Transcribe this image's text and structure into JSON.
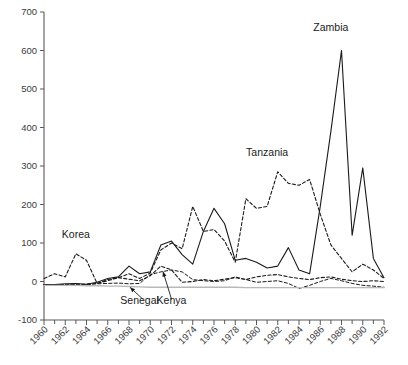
{
  "chart_data": {
    "type": "line",
    "title": "",
    "subtitle": "",
    "xlabel": "",
    "ylabel": "",
    "xlim": [
      1960,
      1992
    ],
    "ylim": [
      -100,
      700
    ],
    "grid": false,
    "legend_position": "inline-annotations",
    "y_ticks": [
      -100,
      0,
      100,
      200,
      300,
      400,
      500,
      600,
      700
    ],
    "y_tick_labels": [
      "-100",
      "0",
      "100",
      "200",
      "300",
      "400",
      "500",
      "600",
      "700"
    ],
    "x_ticks": [
      1960,
      1962,
      1964,
      1966,
      1968,
      1970,
      1972,
      1974,
      1976,
      1978,
      1980,
      1982,
      1984,
      1986,
      1988,
      1990,
      1992
    ],
    "x_tick_labels": [
      "1960",
      "1962",
      "1964",
      "1966",
      "1968",
      "1970",
      "1972",
      "1974",
      "1976",
      "1978",
      "1980",
      "1982",
      "1984",
      "1986",
      "1988",
      "1990",
      "1992"
    ],
    "x_minor_ticks": [
      1961,
      1963,
      1965,
      1967,
      1969,
      1971,
      1973,
      1975,
      1977,
      1979,
      1981,
      1983,
      1985,
      1987,
      1989,
      1991
    ],
    "x": [
      1960,
      1961,
      1962,
      1963,
      1964,
      1965,
      1966,
      1967,
      1968,
      1969,
      1970,
      1971,
      1972,
      1973,
      1974,
      1975,
      1976,
      1977,
      1978,
      1979,
      1980,
      1981,
      1982,
      1983,
      1984,
      1985,
      1986,
      1987,
      1988,
      1989,
      1990,
      1991,
      1992
    ],
    "series": [
      {
        "name": "Zambia",
        "style": "solid",
        "color": "#1a1a1a",
        "width": 1.1,
        "label_x": 1987,
        "label_y": 650,
        "values": [
          -8,
          -8,
          -6,
          -5,
          -7,
          -2,
          8,
          12,
          40,
          20,
          25,
          95,
          105,
          70,
          45,
          130,
          190,
          150,
          55,
          60,
          50,
          35,
          40,
          88,
          30,
          20,
          195,
          390,
          600,
          120,
          295,
          60,
          10
        ]
      },
      {
        "name": "Tanzania",
        "style": "dashed",
        "color": "#1a1a1a",
        "width": 1.1,
        "label_x": 1981,
        "label_y": 325,
        "values": [
          -8,
          -8,
          -8,
          -7,
          -7,
          -5,
          2,
          10,
          20,
          8,
          22,
          82,
          100,
          85,
          195,
          130,
          135,
          105,
          50,
          215,
          190,
          195,
          285,
          255,
          250,
          265,
          175,
          95,
          60,
          25,
          45,
          30,
          8
        ]
      },
      {
        "name": "Korea",
        "style": "dashed",
        "color": "#1a1a1a",
        "width": 1.1,
        "label_x": 1963,
        "label_y": 112,
        "values": [
          8,
          20,
          12,
          72,
          55,
          -5,
          5,
          10,
          6,
          2,
          15,
          40,
          30,
          -2,
          0,
          5,
          2,
          6,
          10,
          5,
          12,
          16,
          18,
          12,
          8,
          5,
          10,
          12,
          6,
          2,
          0,
          2,
          0
        ]
      },
      {
        "name": "Kenya",
        "style": "dashed",
        "color": "#1a1a1a",
        "width": 1.0,
        "label_x": 1972,
        "label_y": -58,
        "values": [
          -8,
          -8,
          -8,
          -8,
          -8,
          -6,
          -5,
          -4,
          -6,
          -5,
          18,
          25,
          30,
          25,
          5,
          2,
          0,
          2,
          12,
          5,
          -2,
          0,
          2,
          -5,
          -18,
          -10,
          0,
          8,
          2,
          -5,
          -10,
          -12,
          -15
        ]
      },
      {
        "name": "Senegal",
        "style": "solid",
        "color": "#b8b8b8",
        "width": 1.4,
        "label_x": 1969,
        "label_y": -58,
        "values": [
          -10,
          -10,
          -10,
          -10,
          -11,
          -11,
          -12,
          -12,
          -13,
          -14,
          -15,
          -15,
          -15,
          -15,
          -15,
          -15,
          -15,
          -15,
          -15,
          -16,
          -16,
          -16,
          -16,
          -16,
          -16,
          -16,
          -16,
          -16,
          -16,
          -16,
          -16,
          -16,
          -16
        ]
      }
    ],
    "annotations": [
      {
        "name": "zambia-label",
        "text": "Zambia",
        "x": 1987,
        "y": 650
      },
      {
        "name": "tanzania-label",
        "text": "Tanzania",
        "x": 1981,
        "y": 325
      },
      {
        "name": "korea-label",
        "text": "Korea",
        "x": 1963,
        "y": 112
      },
      {
        "name": "kenya-label",
        "text": "Kenya",
        "x": 1972,
        "y": -58
      },
      {
        "name": "senegal-label",
        "text": "Senegal",
        "x": 1969,
        "y": -58
      }
    ],
    "leader_lines": [
      {
        "name": "senegal-leader",
        "from_x": 1969.3,
        "from_y": -46,
        "to_x": 1968.1,
        "to_y": -15
      },
      {
        "name": "kenya-leader",
        "from_x": 1972.0,
        "from_y": -46,
        "to_x": 1971.2,
        "to_y": 26
      }
    ]
  }
}
